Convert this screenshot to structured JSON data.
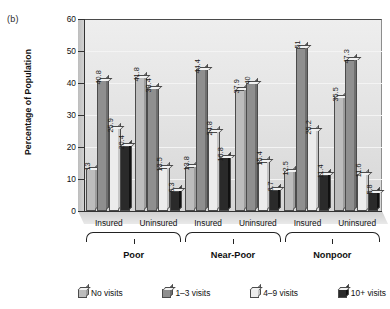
{
  "panel_label": "(b)",
  "chart_data": {
    "type": "bar",
    "title": "",
    "xlabel": "",
    "ylabel": "Percentage of Population",
    "ylim": [
      0,
      60
    ],
    "yticks": [
      0,
      10,
      20,
      30,
      40,
      50,
      60
    ],
    "grid": true,
    "legend_position": "bottom",
    "categories": [
      "Insured",
      "Uninsured",
      "Insured",
      "Uninsured",
      "Insured",
      "Uninsured"
    ],
    "supergroups": [
      {
        "label": "Poor",
        "span": [
          0,
          1
        ]
      },
      {
        "label": "Near-Poor",
        "span": [
          2,
          3
        ]
      },
      {
        "label": "Nonpoor",
        "span": [
          4,
          5
        ]
      }
    ],
    "series": [
      {
        "name": "No visits",
        "color": "#bdbdbd",
        "values": [
          13,
          41.8,
          13.8,
          37.9,
          12.5,
          35.5
        ]
      },
      {
        "name": "1–3 visits",
        "color": "#8f8f8f",
        "values": [
          40.8,
          38.4,
          44.4,
          40,
          51,
          47.3
        ]
      },
      {
        "name": "4–9 visits",
        "color": "#ececec",
        "values": [
          25.9,
          13.5,
          24.8,
          15.4,
          25.2,
          11.6
        ]
      },
      {
        "name": "10+ visits",
        "color": "#2a2a2a",
        "values": [
          20.4,
          6.3,
          16.8,
          6.7,
          11.4,
          5.8
        ]
      }
    ]
  }
}
